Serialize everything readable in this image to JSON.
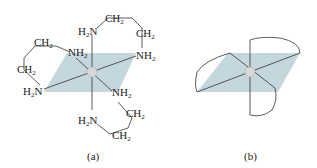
{
  "figure": {
    "panel_a": {
      "caption": "(a)",
      "labels": {
        "top_n": "H",
        "top_n2": "N",
        "ch2": "CH",
        "two": "2",
        "nh": "NH",
        "n": "N",
        "h": "H"
      }
    },
    "panel_b": {
      "caption": "(b)"
    },
    "colors": {
      "plane": "#b9d0d6",
      "line": "#333333",
      "metal": "#d8d8d8"
    }
  }
}
